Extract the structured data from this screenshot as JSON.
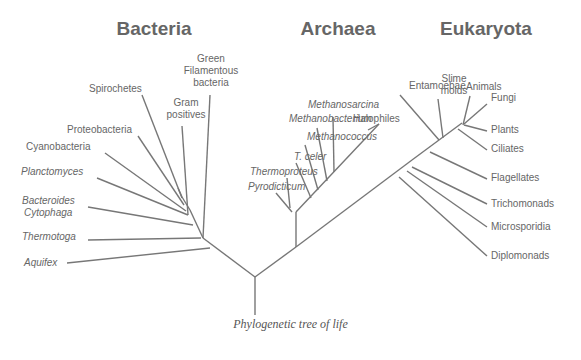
{
  "diagram": {
    "type": "phylogenetic-tree",
    "caption": "Phylogenetic tree of life",
    "line_color": "#777777",
    "text_color": "#666666",
    "domains": [
      {
        "name": "Bacteria",
        "x": 154,
        "y": 35
      },
      {
        "name": "Archaea",
        "x": 338,
        "y": 35
      },
      {
        "name": "Eukaryota",
        "x": 486,
        "y": 35
      }
    ],
    "root": {
      "x": 255,
      "y": 277,
      "trunk_bottom": 315
    },
    "edges": [
      {
        "from": [
          255,
          277
        ],
        "to": [
          203,
          238
        ],
        "note": "root to bacteria"
      },
      {
        "from": [
          255,
          277
        ],
        "to": [
          296,
          247
        ],
        "note": "root to archaea/eukarya"
      },
      {
        "from": [
          296,
          247
        ],
        "to": [
          296,
          212
        ],
        "note": "archaea stem"
      },
      {
        "from": [
          296,
          247
        ],
        "to": [
          412,
          160
        ],
        "note": "eukarya stem"
      },
      {
        "from": [
          203,
          238
        ],
        "to": [
          190,
          210
        ],
        "note": "bacteria internal"
      },
      {
        "from": [
          190,
          210
        ],
        "to": [
          182,
          197
        ]
      },
      {
        "from": [
          182,
          197
        ],
        "to": [
          178,
          188
        ]
      },
      {
        "from": [
          296,
          212
        ],
        "to": [
          379,
          124
        ],
        "note": "archaea internal"
      },
      {
        "from": [
          412,
          160
        ],
        "to": [
          462,
          123
        ],
        "note": "eukarya internal"
      }
    ],
    "leaves": {
      "bacteria": [
        {
          "name": "Aquifex",
          "italic": true,
          "label": [
            24,
            266
          ],
          "tip": [
            67,
            263
          ],
          "attach": [
            210,
            248
          ]
        },
        {
          "name": "Thermotoga",
          "italic": true,
          "label": [
            22,
            240
          ],
          "tip": [
            88,
            240
          ],
          "attach": [
            201,
            238
          ]
        },
        {
          "name": "Bacteroides",
          "italic": true,
          "label": [
            22,
            204
          ],
          "tip": [
            88,
            207
          ],
          "attach": [
            193,
            225
          ]
        },
        {
          "name": "Cytophaga",
          "italic": true,
          "label": [
            24,
            216
          ],
          "tip": null,
          "attach": null
        },
        {
          "name": "Planctomyces",
          "italic": true,
          "label": [
            21,
            175
          ],
          "tip": [
            97,
            178
          ],
          "attach": [
            188,
            215
          ]
        },
        {
          "name": "Cyanobacteria",
          "italic": false,
          "label": [
            26,
            150
          ],
          "tip": [
            105,
            153
          ],
          "attach": [
            186,
            211
          ]
        },
        {
          "name": "Proteobacteria",
          "italic": false,
          "label": [
            67,
            133
          ],
          "tip": [
            138,
            136
          ],
          "attach": [
            184,
            205
          ]
        },
        {
          "name": "Spirochetes",
          "italic": false,
          "label": [
            89,
            92
          ],
          "tip": [
            142,
            95
          ],
          "attach": [
            182,
            198
          ]
        },
        {
          "name": "Gram positives",
          "italic": false,
          "label": [
            186,
            106
          ],
          "tip": [
            182,
            126
          ],
          "attach": [
            188,
            215
          ],
          "lines": [
            "Gram",
            "positives"
          ]
        },
        {
          "name": "Green Filamentous bacteria",
          "italic": false,
          "label": [
            211,
            62
          ],
          "tip": [
            210,
            95
          ],
          "attach": [
            203,
            238
          ],
          "lines": [
            "Green",
            "Filamentous",
            "bacteria"
          ]
        }
      ],
      "archaea": [
        {
          "name": "Pyrodicticum",
          "italic": true,
          "label": [
            248,
            190
          ],
          "tip": [
            276,
            193
          ],
          "attach": [
            292,
            212
          ]
        },
        {
          "name": "Thermoproteus",
          "italic": true,
          "label": [
            250,
            175
          ],
          "tip": [
            287,
            178
          ],
          "attach": [
            290,
            208
          ]
        },
        {
          "name": "T. celer",
          "italic": true,
          "label": [
            294,
            160
          ],
          "tip": [
            296,
            163
          ],
          "attach": [
            311,
            198
          ]
        },
        {
          "name": "Methanococcus",
          "italic": true,
          "label": [
            307,
            140
          ],
          "tip": [
            305,
            145
          ],
          "attach": [
            318,
            190
          ]
        },
        {
          "name": "Methanobacterium",
          "italic": true,
          "label": [
            289,
            122
          ],
          "tip": [
            317,
            128
          ],
          "attach": [
            327,
            181
          ]
        },
        {
          "name": "Methanosarcina",
          "italic": true,
          "label": [
            308,
            108
          ],
          "tip": [
            333,
            117
          ],
          "attach": [
            334,
            172
          ]
        },
        {
          "name": "Halophiles",
          "italic": false,
          "label": [
            353,
            122
          ],
          "tip": [
            368,
            130
          ],
          "attach": [
            379,
            124
          ]
        }
      ],
      "eukaryota": [
        {
          "name": "Entamoebae",
          "italic": false,
          "label": [
            409,
            89
          ],
          "tip": [
            400,
            95
          ],
          "attach": [
            439,
            140
          ]
        },
        {
          "name": "Slime molds",
          "italic": false,
          "label": [
            454,
            82
          ],
          "tip": [
            438,
            99
          ],
          "attach": [
            443,
            138
          ],
          "lines": [
            "Slime",
            "molds"
          ]
        },
        {
          "name": "Animals",
          "italic": false,
          "label": [
            466,
            90
          ],
          "tip": [
            470,
            96
          ],
          "attach": [
            463,
            125
          ]
        },
        {
          "name": "Fungi",
          "italic": false,
          "label": [
            491,
            101
          ],
          "tip": [
            487,
            104
          ],
          "attach": [
            464,
            124
          ]
        },
        {
          "name": "Plants",
          "italic": false,
          "label": [
            491,
            133
          ],
          "tip": [
            487,
            131
          ],
          "attach": [
            464,
            125
          ]
        },
        {
          "name": "Ciliates",
          "italic": false,
          "label": [
            491,
            152
          ],
          "tip": [
            487,
            150
          ],
          "attach": [
            458,
            129
          ]
        },
        {
          "name": "Flagellates",
          "italic": false,
          "label": [
            491,
            181
          ],
          "tip": [
            487,
            179
          ],
          "attach": [
            430,
            152
          ]
        },
        {
          "name": "Trichomonads",
          "italic": false,
          "label": [
            491,
            207
          ],
          "tip": [
            487,
            204
          ],
          "attach": [
            412,
            167
          ]
        },
        {
          "name": "Microsporidia",
          "italic": false,
          "label": [
            491,
            230
          ],
          "tip": [
            487,
            227
          ],
          "attach": [
            407,
            171
          ]
        },
        {
          "name": "Diplomonads",
          "italic": false,
          "label": [
            491,
            259
          ],
          "tip": [
            487,
            256
          ],
          "attach": [
            399,
            177
          ]
        }
      ]
    }
  }
}
